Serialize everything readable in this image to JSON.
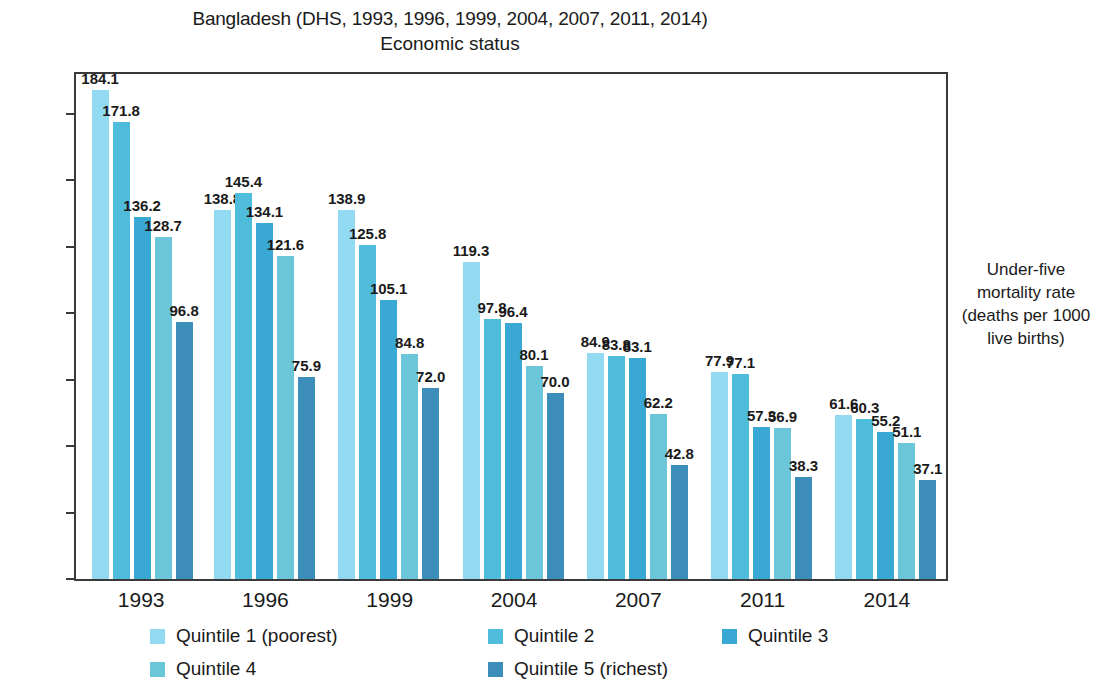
{
  "header": {
    "title": "Bangladesh (DHS, 1993, 1996, 1999, 2004, 2007, 2011, 2014)",
    "subtitle": "Economic status"
  },
  "right_axis_caption": "Under-five mortality rate (deaths per 1000 live births)",
  "legend": {
    "items": [
      {
        "label": "Quintile 1 (poorest)",
        "color": "#92daf2"
      },
      {
        "label": "Quintile 2",
        "color": "#4fbcdc"
      },
      {
        "label": "Quintile 3",
        "color": "#3aa8d4"
      },
      {
        "label": "Quintile 4",
        "color": "#6bc6da"
      },
      {
        "label": "Quintile 5 (richest)",
        "color": "#3d8dba"
      }
    ]
  },
  "chart_data": {
    "type": "bar",
    "title": "Bangladesh (DHS, 1993, 1996, 1999, 2004, 2007, 2011, 2014)",
    "subtitle": "Economic status",
    "xlabel": "",
    "ylabel": "Under-five mortality rate (deaths per 1000 live births)",
    "categories": [
      "1993",
      "1996",
      "1999",
      "2004",
      "2007",
      "2011",
      "2014"
    ],
    "ylim": [
      0,
      190
    ],
    "yticks": [
      0,
      25,
      50,
      75,
      100,
      125,
      150,
      175
    ],
    "ytick_labels": [
      "0",
      "25",
      "50",
      "75",
      "100",
      "125",
      "150",
      "175"
    ],
    "grid": false,
    "legend_position": "bottom",
    "series": [
      {
        "name": "Quintile 1 (poorest)",
        "color": "#92daf2",
        "values": [
          184.1,
          138.8,
          138.9,
          119.3,
          84.9,
          77.9,
          61.6
        ]
      },
      {
        "name": "Quintile 2",
        "color": "#4fbcdc",
        "values": [
          171.8,
          145.4,
          125.8,
          97.8,
          83.8,
          77.1,
          60.3
        ]
      },
      {
        "name": "Quintile 3",
        "color": "#3aa8d4",
        "values": [
          136.2,
          134.1,
          105.1,
          96.4,
          83.1,
          57.3,
          55.2
        ]
      },
      {
        "name": "Quintile 4",
        "color": "#6bc6da",
        "values": [
          128.7,
          121.6,
          84.8,
          80.1,
          62.2,
          56.9,
          51.1
        ]
      },
      {
        "name": "Quintile 5 (richest)",
        "color": "#3d8dba",
        "values": [
          96.8,
          75.9,
          72.0,
          70.0,
          42.8,
          38.3,
          37.1
        ]
      }
    ]
  }
}
